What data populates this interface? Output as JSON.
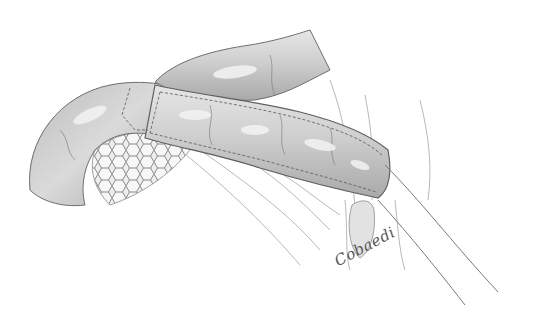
{
  "illustration": {
    "subject": "surgical illustration of intestinal segment wrapped with sleeve over mesh, with tube",
    "style": "graphite pencil rendering",
    "signature": "Cobaedi",
    "colors": {
      "background": "#ffffff",
      "tissue_fill": "#c9c9c9",
      "tissue_highlight": "#f2f2f2",
      "outline": "#6e6e6e",
      "stitch": "#555555"
    },
    "elements": [
      {
        "name": "upper-bowel-loop"
      },
      {
        "name": "left-bowel-loop"
      },
      {
        "name": "wrapped-sleeve-segment"
      },
      {
        "name": "hexagonal-mesh"
      },
      {
        "name": "mesentery-folds"
      },
      {
        "name": "tube"
      },
      {
        "name": "signature"
      }
    ]
  }
}
